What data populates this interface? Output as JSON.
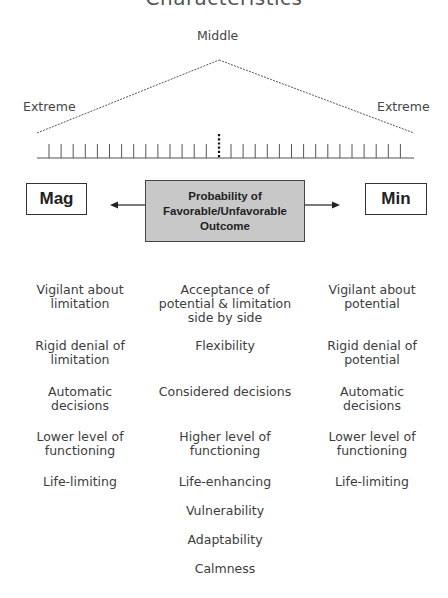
{
  "title": "Characteristics",
  "scale": {
    "middle_label": "Middle",
    "left_extreme_label": "Extreme",
    "right_extreme_label": "Extreme",
    "left_tick_count": 14,
    "right_tick_count": 15
  },
  "boxes": {
    "left": "Mag",
    "right": "Min",
    "center_lines": [
      "Probability of",
      "Favorable/Unfavorable",
      "Outcome"
    ]
  },
  "colors": {
    "center_box_fill": "#c8c8c8",
    "line": "#555555",
    "text": "#3d3d3d"
  },
  "columns": {
    "left": [
      "Vigilant about limitation",
      "Rigid denial of limitation",
      "Automatic decisions",
      "Lower level of functioning",
      "Life-limiting"
    ],
    "center": [
      "Acceptance of potential & limitation side by side",
      "Flexibility",
      "Considered decisions",
      "Higher level of functioning",
      "Life-enhancing",
      "Vulnerability",
      "Adaptability",
      "Calmness"
    ],
    "right": [
      "Vigilant about potential",
      "Rigid denial of potential",
      "Automatic decisions",
      "Lower level of functioning",
      "Life-limiting"
    ]
  },
  "column_lines": {
    "left": [
      [
        "Vigilant about",
        "limitation"
      ],
      [
        "Rigid denial of",
        "limitation"
      ],
      [
        "Automatic",
        "decisions"
      ],
      [
        "Lower level of",
        "functioning"
      ],
      [
        "Life-limiting"
      ]
    ],
    "center": [
      [
        "Acceptance of",
        "potential & limitation",
        "side by side"
      ],
      [
        "Flexibility"
      ],
      [
        "Considered decisions"
      ],
      [
        "Higher level of",
        "functioning"
      ],
      [
        "Life-enhancing"
      ],
      [
        "Vulnerability"
      ],
      [
        "Adaptability"
      ],
      [
        "Calmness"
      ]
    ],
    "right": [
      [
        "Vigilant about",
        "potential"
      ],
      [
        "Rigid denial of",
        "potential"
      ],
      [
        "Automatic",
        "decisions"
      ],
      [
        "Lower level of",
        "functioning"
      ],
      [
        "Life-limiting"
      ]
    ]
  }
}
